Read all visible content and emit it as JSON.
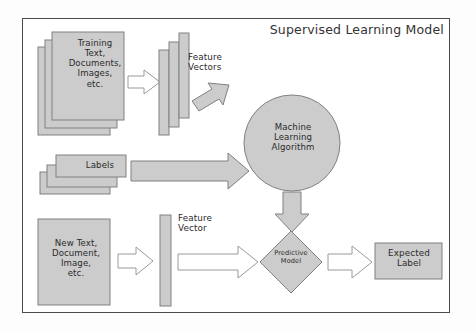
{
  "diagram": {
    "title": "Supervised Learning Model",
    "background_color": "#ffffff",
    "frame_color": "#4a4a4a",
    "shape_fill": "#cccccc",
    "shape_stroke": "#808080",
    "arrow_fill_solid": "#cccccc",
    "arrow_fill_hollow": "#ffffff",
    "text_color": "#2b2b2b"
  },
  "nodes": {
    "training_docs": {
      "label": "Training\nText,\nDocuments,\nImages,\netc.",
      "shape": "stacked-documents",
      "stack_count": 3
    },
    "feature_vectors": {
      "label": "Feature\nVectors",
      "shape": "stacked-bars",
      "bar_count": 3
    },
    "ml_algorithm": {
      "label": "Machine\nLearning\nAlgorithm",
      "shape": "circle"
    },
    "labels_stack": {
      "label": "Labels",
      "shape": "stacked-documents",
      "stack_count": 3
    },
    "new_text": {
      "label": "New Text,\nDocument,\nImage,\netc.",
      "shape": "rectangle"
    },
    "feature_vector": {
      "label": "Feature\nVector",
      "shape": "single-bar",
      "bar_count": 1
    },
    "predictive_model": {
      "label": "Predictive\nModel",
      "shape": "diamond"
    },
    "expected_label": {
      "label": "Expected\nLabel",
      "shape": "rectangle"
    }
  },
  "edges": [
    {
      "name": "training-to-featurevectors",
      "from": "training_docs",
      "to": "feature_vectors",
      "style": "hollow",
      "direction": "right"
    },
    {
      "name": "featurevectors-to-mla",
      "from": "feature_vectors",
      "to": "ml_algorithm",
      "style": "solid",
      "direction": "down-right"
    },
    {
      "name": "labels-to-mla",
      "from": "labels_stack",
      "to": "ml_algorithm",
      "style": "solid",
      "direction": "right"
    },
    {
      "name": "mla-to-predictivemodel",
      "from": "ml_algorithm",
      "to": "predictive_model",
      "style": "solid",
      "direction": "down"
    },
    {
      "name": "newtext-to-featurevector",
      "from": "new_text",
      "to": "feature_vector",
      "style": "hollow",
      "direction": "right"
    },
    {
      "name": "featurevector-to-predmodel",
      "from": "feature_vector",
      "to": "predictive_model",
      "style": "hollow",
      "direction": "right"
    },
    {
      "name": "predmodel-to-expectedlabel",
      "from": "predictive_model",
      "to": "expected_label",
      "style": "hollow",
      "direction": "right"
    }
  ]
}
